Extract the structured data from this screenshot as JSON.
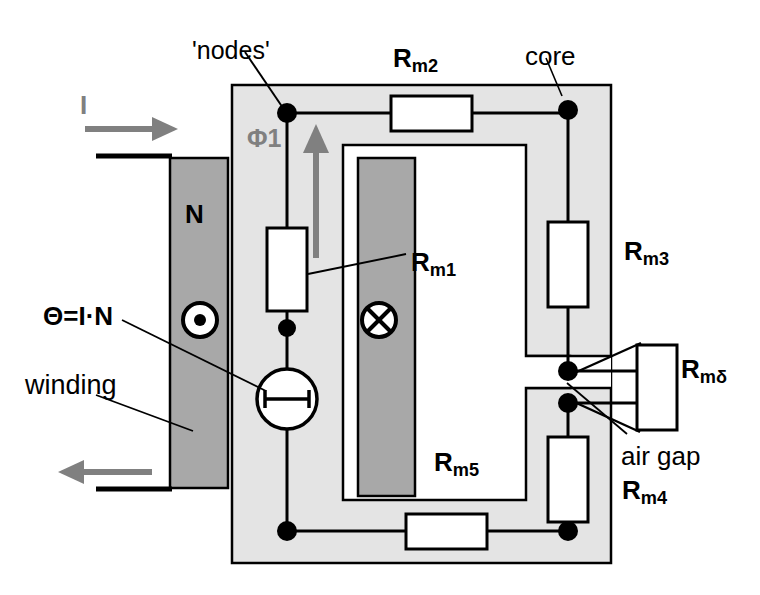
{
  "figure": {
    "kind": "magnetic-circuit-reluctance-diagram",
    "width": 760,
    "height": 595,
    "background": "#ffffff"
  },
  "colors": {
    "core_fill": "#e4e4e4",
    "winding_fill": "#a8a8a8",
    "line": "#000000",
    "arrow_gray": "#808080",
    "label_gray": "#808080",
    "resistor_fill": "#ffffff",
    "source_fill": "#ffffff",
    "window_fill": "#ffffff"
  },
  "labels": {
    "nodes": {
      "text": "'nodes'",
      "x": 192,
      "y": 38,
      "size": 25,
      "bold": false,
      "color": "#000000"
    },
    "current": {
      "text": "I",
      "x": 80,
      "y": 92,
      "size": 26,
      "bold": true,
      "color": "#808080"
    },
    "turns": {
      "text": "N",
      "x": 185,
      "y": 201,
      "size": 26,
      "bold": true,
      "color": "#000000"
    },
    "mmf": {
      "text": "Θ=I·N",
      "x": 43,
      "y": 303,
      "size": 26,
      "bold": true,
      "color": "#000000"
    },
    "winding": {
      "text": "winding",
      "x": 25,
      "y": 372,
      "size": 27,
      "bold": false,
      "color": "#000000"
    },
    "flux1": {
      "text": "Φ1",
      "x": 247,
      "y": 126,
      "size": 25,
      "bold": true,
      "color": "#808080"
    },
    "rm1": {
      "text": "R",
      "sub": "m1",
      "x": 411,
      "y": 249,
      "size": 26,
      "bold": true,
      "color": "#000000"
    },
    "rm2": {
      "text": "R",
      "sub": "m2",
      "x": 393,
      "y": 45,
      "size": 26,
      "bold": true,
      "color": "#000000"
    },
    "rm3": {
      "text": "R",
      "sub": "m3",
      "x": 624,
      "y": 238,
      "size": 26,
      "bold": true,
      "color": "#000000"
    },
    "rm4": {
      "text": "R",
      "sub": "m4",
      "x": 622,
      "y": 477,
      "size": 26,
      "bold": true,
      "color": "#000000"
    },
    "rm5": {
      "text": "R",
      "sub": "m5",
      "x": 434,
      "y": 449,
      "size": 26,
      "bold": true,
      "color": "#000000"
    },
    "rmdelta": {
      "text": "R",
      "sub": "mδ",
      "x": 681,
      "y": 356,
      "size": 26,
      "bold": true,
      "color": "#000000"
    },
    "core": {
      "text": "core",
      "x": 525,
      "y": 43,
      "size": 26,
      "bold": false,
      "color": "#000000"
    },
    "air_gap": {
      "text": "air gap",
      "x": 621,
      "y": 443,
      "size": 26,
      "bold": false,
      "color": "#000000"
    }
  },
  "icons": {
    "current_out_of_page": {
      "name": "dot-in-circle-icon",
      "cx": 200,
      "cy": 320,
      "r": 17,
      "inner_r": 6
    },
    "current_into_page": {
      "name": "cross-in-circle-icon",
      "cx": 379,
      "cy": 320,
      "r": 17
    },
    "mmf_source": {
      "name": "mmf-source-icon",
      "cx": 287,
      "cy": 399,
      "r": 30
    }
  },
  "geometry": {
    "core_outer": {
      "x": 232,
      "y": 85,
      "w": 379,
      "h": 478
    },
    "core_window": {
      "x": 343,
      "y": 145,
      "w": 183,
      "h": 355
    },
    "inner_bar": {
      "x": 358,
      "y": 158,
      "w": 57,
      "h": 338
    },
    "winding_bar": {
      "x": 170,
      "y": 158,
      "w": 58,
      "h": 330
    },
    "lead_top": {
      "x1": 96,
      "y1": 156,
      "x2": 171,
      "y2": 156
    },
    "lead_bottom": {
      "x1": 96,
      "y1": 489,
      "x2": 171,
      "y2": 489
    },
    "arrow_in": {
      "x1": 85,
      "y1": 129,
      "x2": 172,
      "y2": 129
    },
    "arrow_out": {
      "x1": 150,
      "y1": 472,
      "x2": 60,
      "y2": 472
    },
    "flux_arrow": {
      "x1": 316,
      "y1": 256,
      "x2": 316,
      "y2": 128
    }
  },
  "nodes": [
    {
      "name": "node-top-left",
      "x": 287,
      "y": 113
    },
    {
      "name": "node-top-right",
      "x": 568,
      "y": 110
    },
    {
      "name": "node-mid-left",
      "x": 287,
      "y": 328
    },
    {
      "name": "node-gap-upper",
      "x": 568,
      "y": 371
    },
    {
      "name": "node-gap-lower",
      "x": 568,
      "y": 403
    },
    {
      "name": "node-bottom-left",
      "x": 287,
      "y": 531
    },
    {
      "name": "node-bottom-right",
      "x": 568,
      "y": 531
    }
  ],
  "resistors": [
    {
      "name": "resistor-rm1",
      "x": 267,
      "y": 228,
      "w": 40,
      "h": 83,
      "orientation": "vertical",
      "label": "R_m1"
    },
    {
      "name": "resistor-rm2",
      "x": 390,
      "y": 97,
      "w": 83,
      "h": 35,
      "orientation": "horizontal",
      "label": "R_m2"
    },
    {
      "name": "resistor-rm3",
      "x": 549,
      "y": 222,
      "w": 40,
      "h": 85,
      "orientation": "vertical",
      "label": "R_m3"
    },
    {
      "name": "resistor-rm4",
      "x": 549,
      "y": 437,
      "w": 40,
      "h": 85,
      "orientation": "vertical",
      "label": "R_m4"
    },
    {
      "name": "resistor-rm5",
      "x": 405,
      "y": 513,
      "w": 83,
      "h": 35,
      "orientation": "horizontal",
      "label": "R_m5"
    },
    {
      "name": "resistor-rmdelta",
      "x": 637,
      "y": 345,
      "w": 40,
      "h": 85,
      "orientation": "vertical",
      "label": "R_mδ"
    }
  ],
  "leader_lines": [
    {
      "name": "leader-nodes",
      "x1": 245,
      "y1": 50,
      "x2": 284,
      "y2": 110
    },
    {
      "name": "leader-core",
      "x1": 545,
      "y1": 57,
      "x2": 562,
      "y2": 95
    },
    {
      "name": "leader-rm1",
      "x1": 405,
      "y1": 257,
      "x2": 307,
      "y2": 274
    },
    {
      "name": "leader-mmf",
      "x1": 120,
      "y1": 318,
      "x2": 268,
      "y2": 392
    },
    {
      "name": "leader-winding",
      "x1": 95,
      "y1": 394,
      "x2": 192,
      "y2": 430
    },
    {
      "name": "leader-airgap-upper",
      "x1": 638,
      "y1": 345,
      "x2": 572,
      "y2": 372
    },
    {
      "name": "leader-airgap-lower",
      "x1": 637,
      "y1": 430,
      "x2": 572,
      "y2": 402
    },
    {
      "name": "leader-airgap-text",
      "x1": 628,
      "y1": 432,
      "x2": 566,
      "y2": 385
    }
  ]
}
